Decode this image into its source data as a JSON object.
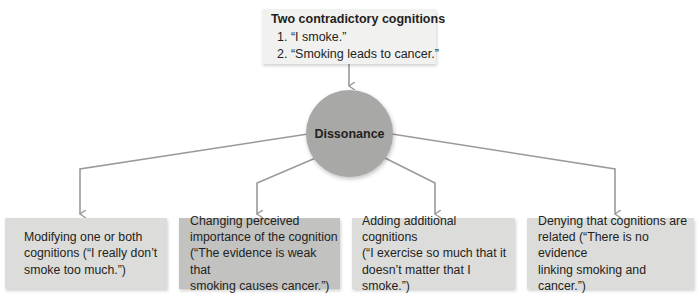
{
  "top": {
    "title": "Two contradictory cognitions",
    "items": [
      "1. “I smoke.”",
      "2. “Smoking leads to cancer.”"
    ]
  },
  "center": {
    "label": "Dissonance"
  },
  "outcomes": [
    {
      "lines": [
        "Modifying one or both",
        "cognitions (“I really don’t",
        "smoke too much.”)"
      ]
    },
    {
      "lines": [
        "Changing perceived",
        "importance of the cognition",
        "(“The evidence is weak that",
        "smoking causes cancer.”)"
      ]
    },
    {
      "lines": [
        "Adding additional cognitions",
        "(“I exercise so much that it",
        "doesn’t matter that I smoke.”)"
      ]
    },
    {
      "lines": [
        "Denying that cognitions are",
        "related (“There is no evidence",
        "linking smoking and cancer.”)"
      ]
    }
  ],
  "colors": {
    "line": "#9a9a99",
    "circle": "#a8a8a7",
    "box_light": "#dcdcdb",
    "box_dark": "#c2c2c1",
    "top_box": "#f1f1f0"
  }
}
